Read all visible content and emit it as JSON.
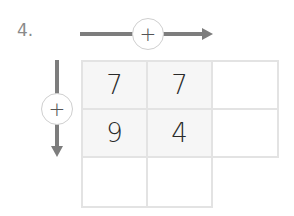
{
  "problem": {
    "number_label": "4."
  },
  "operators": {
    "horizontal": {
      "symbol": "+",
      "direction": "right"
    },
    "vertical": {
      "symbol": "+",
      "direction": "down"
    }
  },
  "grid": {
    "rows": 3,
    "cols": 3,
    "cells": [
      [
        "7",
        "7",
        ""
      ],
      [
        "9",
        "4",
        ""
      ],
      [
        "",
        "",
        null
      ]
    ]
  },
  "colors": {
    "arrow": "#7d7d7d",
    "grid_border": "#e3e3e3",
    "filled_cell_bg": "#f6f6f6",
    "digit": "#2a2a2a",
    "number_label": "#8a8a8a"
  }
}
